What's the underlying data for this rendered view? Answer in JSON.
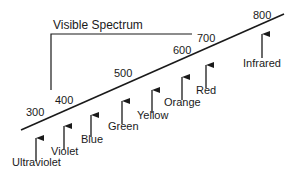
{
  "diagram": {
    "title": "Visible Spectrum",
    "wavelength_labels": [
      "300",
      "400",
      "500",
      "600",
      "700",
      "800"
    ],
    "bands": [
      "Ultraviolet",
      "Violet",
      "Blue",
      "Green",
      "Yellow",
      "Orange",
      "Red",
      "Infrared"
    ],
    "line_color": "#1a1a1a"
  }
}
